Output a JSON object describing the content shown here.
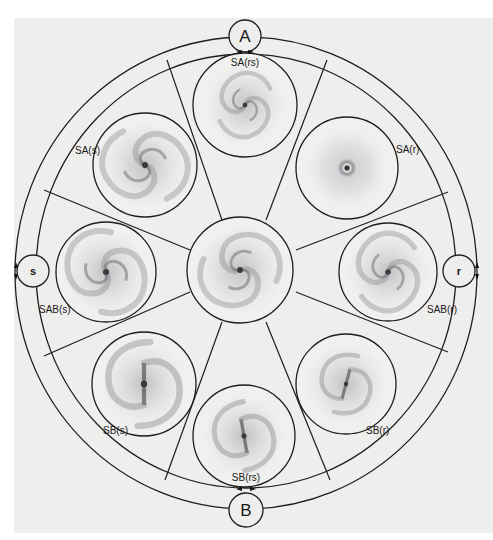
{
  "diagram": {
    "title": "",
    "colors": {
      "background": "#eeeeec",
      "line": "#1e1e1e",
      "galaxy_ink": "#6e6e72"
    },
    "poles": {
      "top": {
        "label": "A"
      },
      "bottom": {
        "label": "B"
      },
      "left": {
        "label": "s"
      },
      "right": {
        "label": "r"
      }
    },
    "galaxies": [
      {
        "id": "center",
        "label": ""
      },
      {
        "id": "sa_rs",
        "label": "SA(rs)"
      },
      {
        "id": "sa_s",
        "label": "SA(s)"
      },
      {
        "id": "sa_r",
        "label": "SA(r)"
      },
      {
        "id": "sab_s",
        "label": "SAB(s)"
      },
      {
        "id": "sab_r",
        "label": "SAB(r)"
      },
      {
        "id": "sb_s",
        "label": "SB(s)"
      },
      {
        "id": "sb_rs",
        "label": "SB(rs)"
      },
      {
        "id": "sb_r",
        "label": "SB(r)"
      }
    ]
  }
}
